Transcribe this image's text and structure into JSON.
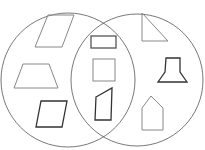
{
  "diagram": {
    "type": "venn",
    "sets": 2,
    "circle_color": "#555555",
    "shape_color_light": "#888888",
    "shape_color_dark": "#333333",
    "left_only": [
      "parallelogram",
      "trapezoid",
      "rhombus"
    ],
    "intersection": [
      "rectangle",
      "square",
      "quadrilateral"
    ],
    "right_only": [
      "right-triangle",
      "hexagon-flared",
      "pentagon-house"
    ],
    "cropped_title_fragment": ""
  }
}
